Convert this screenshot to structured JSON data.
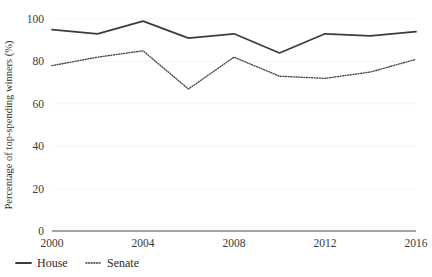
{
  "chart_data": {
    "type": "line",
    "title": "",
    "xlabel": "",
    "ylabel": "Percentage of top-spending winners (%)",
    "x": [
      2000,
      2002,
      2004,
      2006,
      2008,
      2010,
      2012,
      2014,
      2016
    ],
    "xtick_labels": [
      "2000",
      "2004",
      "2008",
      "2012",
      "2016"
    ],
    "xticks": [
      2000,
      2004,
      2008,
      2012,
      2016
    ],
    "ytick_labels": [
      "0",
      "20",
      "40",
      "60",
      "80",
      "100"
    ],
    "yticks": [
      0,
      20,
      40,
      60,
      80,
      100
    ],
    "xlim": [
      2000,
      2016
    ],
    "ylim": [
      0,
      100
    ],
    "grid": true,
    "legend_position": "below-left",
    "series": [
      {
        "name": "House",
        "style": "solid",
        "color": "#3c3c3c",
        "values": [
          95,
          93,
          99,
          91,
          93,
          84,
          93,
          92,
          94
        ]
      },
      {
        "name": "Senate",
        "style": "dotted",
        "color": "#4a4a4a",
        "values": [
          78,
          82,
          85,
          67,
          82,
          73,
          72,
          75,
          81
        ]
      }
    ]
  },
  "legend": {
    "items": [
      {
        "label": "House",
        "style": "solid"
      },
      {
        "label": "Senate",
        "style": "dotted"
      }
    ]
  }
}
